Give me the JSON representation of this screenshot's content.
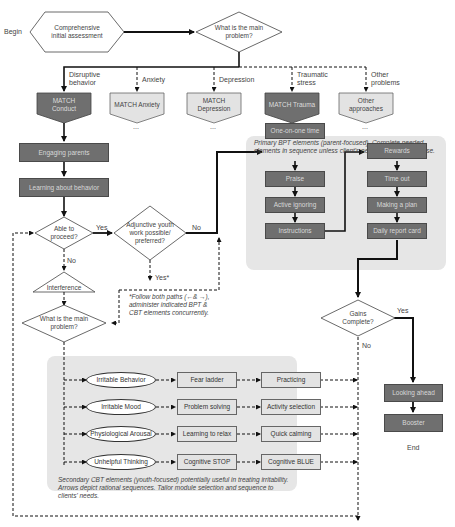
{
  "start": {
    "begin_label": "Begin",
    "assessment": "Comprehensive initial assessment"
  },
  "main_problem_1": "What is the main problem?",
  "branches": [
    {
      "label": "Disruptive behavior",
      "module": "MATCH Conduct",
      "style": "dark"
    },
    {
      "label": "Anxiety",
      "module": "MATCH Anxiety",
      "style": "light"
    },
    {
      "label": "Depression",
      "module": "MATCH Depression",
      "style": "light"
    },
    {
      "label": "Traumatic stress",
      "module": "MATCH Trauma",
      "style": "dark"
    },
    {
      "label": "Other problems",
      "module": "Other approaches",
      "style": "light"
    }
  ],
  "ellipsis": "...",
  "left_steps": [
    "Engaging parents",
    "Learning about behavior"
  ],
  "decisions": {
    "able_to_proceed": "Able to proceed?",
    "yes": "Yes",
    "no": "No",
    "adjunctive": "Adjunctive youth work possible/ preferred?",
    "yes_star": "Yes*",
    "interference": "Interference",
    "main_problem_2": "What is the main problem?",
    "gains_complete": "Gains Complete?"
  },
  "footnote": "*Follow both paths (←& →), administer indicated BPT & CBT elements concurrently.",
  "bpt_panel": {
    "caption": "Primary BPT elements (parent-focused). Complete needed elements in sequence unless client's needs suggest otherwise.",
    "col1": [
      "One-on-one time",
      "Praise",
      "Active ignoring",
      "Instructions"
    ],
    "col2": [
      "Rewards",
      "Time out",
      "Making a plan",
      "Daily report card"
    ]
  },
  "cbt_panel": {
    "rows": [
      {
        "problem": "Irritable Behavior",
        "step1": "Fear ladder",
        "step2": "Practicing"
      },
      {
        "problem": "Irritable Mood",
        "step1": "Problem solving",
        "step2": "Activity selection"
      },
      {
        "problem": "Physiological Arousal",
        "step1": "Learning to relax",
        "step2": "Quick calming"
      },
      {
        "problem": "Unhelpful Thinking",
        "step1": "Cognitive STOP",
        "step2": "Cognitive BLUE"
      }
    ],
    "caption": "Secondary CBT elements (youth-focused) potentially useful in treating irritability. Arrows depict rational sequences. Tailor module selection and sequence to clients' needs."
  },
  "end_steps": [
    "Looking ahead",
    "Booster"
  ],
  "end_label": "End",
  "colors": {
    "dark_box": "#6f6f6f",
    "light_box": "#e3e3e3",
    "panel": "#e6e6e6",
    "line": "#111111"
  }
}
